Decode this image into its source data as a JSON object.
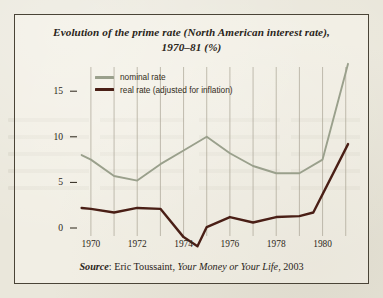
{
  "figure": {
    "title": "Evolution of the prime rate (North American interest rate), 1970–81 (%)",
    "title_line1": "Evolution of the prime rate (North American interest rate),",
    "title_line2": "1970–81 (%)",
    "source_prefix": "Source",
    "source_sep": ": ",
    "source_author": "Eric Toussaint, ",
    "source_work": "Your Money or Your Life",
    "source_year": ", 2003"
  },
  "colors": {
    "nominal": "#9aa08c",
    "real": "#4a1f16",
    "grid": "#a9a494",
    "text": "#2a2419",
    "frame": "#4a4437",
    "paper": "#eae7db"
  },
  "chart_data": {
    "type": "line",
    "title": "Evolution of the prime rate (North American interest rate), 1970–81 (%)",
    "xlabel": "",
    "ylabel": "",
    "xlim": [
      1969.4,
      1981.4
    ],
    "ylim": [
      -3.0,
      19.0
    ],
    "yticks": [
      0,
      5,
      10,
      15
    ],
    "ytick_labels": [
      "0",
      "5",
      "10",
      "15"
    ],
    "xticks": [
      1970,
      1971,
      1972,
      1973,
      1974,
      1975,
      1976,
      1977,
      1978,
      1979,
      1980,
      1981
    ],
    "xtick_labels": [
      "1970",
      "",
      "1972",
      "",
      "1974",
      "",
      "1976",
      "",
      "1978",
      "",
      "1980",
      ""
    ],
    "xtick_labels_shown": [
      "1970",
      "1972",
      "1974",
      "1976",
      "1978",
      "1980"
    ],
    "grid": "vertical-only",
    "legend_position": "upper-left-inside",
    "series": [
      {
        "name": "nominal rate",
        "color": "#9aa08c",
        "x": [
          1969.6,
          1970,
          1971,
          1972,
          1973,
          1974,
          1975,
          1976,
          1977,
          1978,
          1979,
          1980,
          1981.1
        ],
        "values": [
          8.0,
          7.5,
          5.7,
          5.2,
          7.0,
          8.5,
          10.0,
          8.2,
          6.8,
          6.0,
          6.0,
          7.5,
          18.0
        ]
      },
      {
        "name": "real rate (adjusted for inflation)",
        "color": "#4a1f16",
        "x": [
          1969.6,
          1970,
          1971,
          1972,
          1973,
          1974,
          1974.6,
          1975,
          1976,
          1977,
          1978,
          1979,
          1979.6,
          1981.1
        ],
        "values": [
          2.2,
          2.1,
          1.7,
          2.2,
          2.1,
          -1.0,
          -2.0,
          0.1,
          1.2,
          0.6,
          1.2,
          1.3,
          1.7,
          9.2
        ]
      }
    ]
  }
}
